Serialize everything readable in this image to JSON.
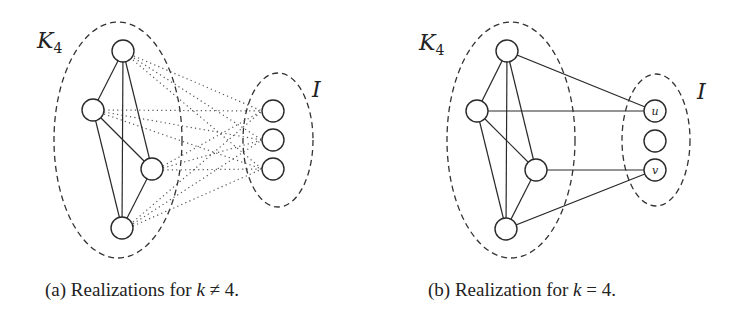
{
  "figure_a": {
    "group_label": "K",
    "group_subscript": "4",
    "independent_label": "I",
    "caption_prefix": "(a) Realizations for ",
    "caption_var": "k",
    "caption_rel": " ≠ 4.",
    "k4_nodes": [
      [
        123,
        51
      ],
      [
        93,
        110
      ],
      [
        152,
        169
      ],
      [
        122,
        228
      ]
    ],
    "i_nodes": [
      [
        273,
        111
      ],
      [
        273,
        140
      ],
      [
        273,
        169
      ]
    ],
    "edge_style": "dotted between K4 and I, solid within K4"
  },
  "figure_b": {
    "group_label": "K",
    "group_subscript": "4",
    "independent_label": "I",
    "node_u_label": "u",
    "node_v_label": "v",
    "caption_prefix": "(b) Realization for ",
    "caption_var": "k",
    "caption_rel": " = 4.",
    "k4_nodes": [
      [
        507,
        51
      ],
      [
        477,
        111
      ],
      [
        536,
        170
      ],
      [
        506,
        229
      ]
    ],
    "i_nodes": [
      [
        655,
        111
      ],
      [
        655,
        141
      ],
      [
        655,
        170
      ]
    ],
    "edge_style": "solid edges from K4 to u and v"
  }
}
